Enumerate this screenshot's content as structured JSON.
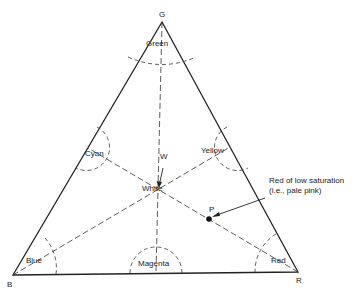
{
  "diagram": {
    "type": "color-triangle",
    "vertices": {
      "top": "G",
      "left": "B",
      "right": "R"
    },
    "regions": {
      "green": "Green",
      "cyan": "Cyan",
      "yellow": "Yellow",
      "blue": "Blue",
      "magenta": "Magenta",
      "red": "Red",
      "white": "White"
    },
    "markers": {
      "w": "W",
      "p": "P"
    },
    "annotation": "Red of low saturation (i.e., pale pink)",
    "colors": {
      "line": "#222222",
      "background": "#ffffff"
    }
  }
}
